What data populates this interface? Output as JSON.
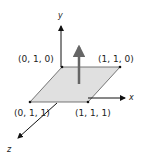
{
  "diagram": {
    "axes": {
      "x_label": "x",
      "y_label": "y",
      "z_label": "z"
    },
    "plane": {
      "fill_color": "#e0e0e0",
      "edge_color": "#555555",
      "corners": [
        {
          "label": "(0, 1, 0)"
        },
        {
          "label": "(1, 1, 0)"
        },
        {
          "label": "(0, 1, 1)"
        },
        {
          "label": "(1, 1, 1)"
        }
      ]
    },
    "normal_vector": {
      "color": "#666666"
    },
    "axis_color": "#111111"
  }
}
